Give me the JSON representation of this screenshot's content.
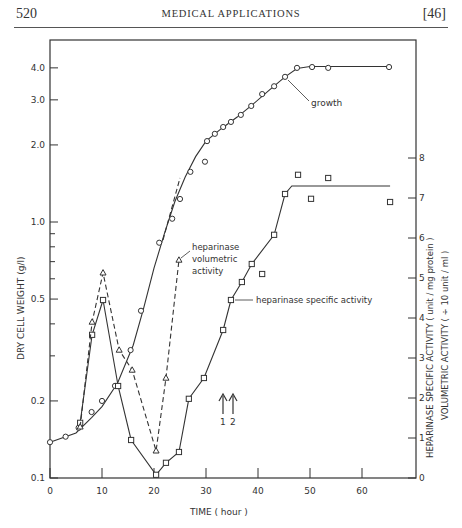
{
  "header": {
    "page_number": "520",
    "running_title": "MEDICAL APPLICATIONS",
    "section": "[46]"
  },
  "chart_data": {
    "type": "line",
    "title": "",
    "xlabel": "TIME ( hour )",
    "ylabel_left": "DRY CELL WEIGHT (g/l)",
    "ylabel_right_1": "HEPARINASE SPECIFIC ACTIVITY ( unit / mg protein )",
    "ylabel_right_2": "VOLUMETRIC ACTIVITY ( ÷ 10 unit / ml )",
    "x_ticks": [
      "0",
      "10",
      "20",
      "30",
      "40",
      "50",
      "60"
    ],
    "xlim": [
      0,
      68
    ],
    "y_left_scale": "log",
    "y_left_ticks": [
      "0.1",
      "0.2",
      "0.5",
      "1.0",
      "2.0",
      "3.0",
      "4.0"
    ],
    "ylim_left": [
      0.1,
      4.8
    ],
    "y_right_ticks": [
      "0",
      "1",
      "2",
      "3",
      "4",
      "5",
      "6",
      "7",
      "8"
    ],
    "ylim_right": [
      0,
      8
    ],
    "grid": false,
    "series": [
      {
        "name": "growth",
        "axis": "left",
        "marker": "circle",
        "line": "solid",
        "x": [
          0,
          3,
          5.5,
          8,
          10,
          12.5,
          15.5,
          17.5,
          21,
          23.5,
          25,
          27,
          29.8,
          30.2,
          31.7,
          33.3,
          34.8,
          36.7,
          38.7,
          40.8,
          43.1,
          45.2,
          47.5,
          50.4,
          53.5,
          65.2
        ],
        "y": [
          0.138,
          0.145,
          0.157,
          0.181,
          0.2,
          0.229,
          0.316,
          0.45,
          0.83,
          1.03,
          1.23,
          1.57,
          1.72,
          2.07,
          2.21,
          2.35,
          2.46,
          2.62,
          2.84,
          3.16,
          3.39,
          3.69,
          4.0,
          4.03,
          4.0,
          4.03
        ]
      },
      {
        "name": "heparinase specific activity",
        "axis": "right",
        "marker": "square",
        "line": "solid",
        "x": [
          5.8,
          8.1,
          10.2,
          13.1,
          15.6,
          20.4,
          22.3,
          24.8,
          26.7,
          29.6,
          33.3,
          34.8,
          36.9,
          38.8,
          40.8,
          43.1,
          45.2,
          47.7,
          50.2,
          53.5,
          65.4
        ],
        "y": [
          1.38,
          3.58,
          4.45,
          2.3,
          0.95,
          0.08,
          0.38,
          0.65,
          1.98,
          2.5,
          3.7,
          4.45,
          4.9,
          5.35,
          5.1,
          6.08,
          7.1,
          7.58,
          6.98,
          7.5,
          6.9
        ]
      },
      {
        "name": "heparinase volumetric activity",
        "axis": "right",
        "marker": "triangle",
        "line": "dashed",
        "x": [
          5.8,
          8.1,
          10.2,
          13.3,
          15.8,
          20.4,
          22.3,
          24.8
        ],
        "y": [
          1.28,
          3.9,
          5.13,
          3.2,
          2.7,
          0.68,
          2.5,
          5.45
        ]
      }
    ],
    "annotations": [
      {
        "text": "growth",
        "near_x": 47,
        "near_y_left": 3.8
      },
      {
        "text": "heparinase volumetric activity",
        "near_x": 25,
        "near_y_right": 5.45
      },
      {
        "text": "heparinase specific activity",
        "near_x": 35,
        "near_y_right": 4.9
      },
      {
        "text": "1",
        "x": 32.5,
        "type": "arrow"
      },
      {
        "text": "2",
        "x": 34.5,
        "type": "arrow"
      }
    ]
  },
  "labels": {
    "growth": "growth",
    "vol_1": "heparinase",
    "vol_2": "volumetric",
    "vol_3": "activity",
    "spec": "heparinase  specific  activity",
    "arrow_1": "1",
    "arrow_2": "2",
    "xlabel": "TIME   ( hour )",
    "ylabel_left": "DRY  CELL  WEIGHT   (g/l)",
    "ylabel_right_1": "HEPARINASE  SPECIFIC  ACTIVITY  ( unit / mg protein )",
    "ylabel_right_2": "VOLUMETRIC  ACTIVITY  ( ÷ 10  unit / ml )"
  }
}
